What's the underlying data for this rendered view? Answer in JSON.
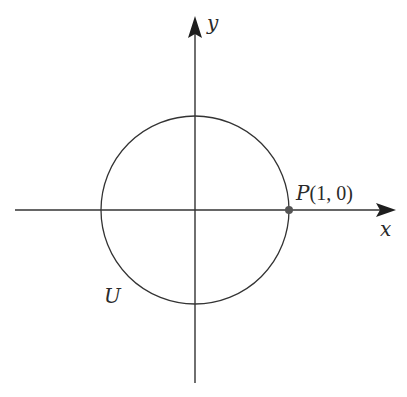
{
  "diagram": {
    "type": "unit-circle",
    "axes": {
      "x_label": "x",
      "y_label": "y"
    },
    "circle": {
      "label": "U",
      "center": [
        0,
        0
      ],
      "radius": 1
    },
    "point": {
      "name": "P",
      "coords_text": "(1, 0)",
      "coords": [
        1,
        0
      ]
    },
    "colors": {
      "stroke": "#333333",
      "point_fill": "#555555"
    }
  }
}
